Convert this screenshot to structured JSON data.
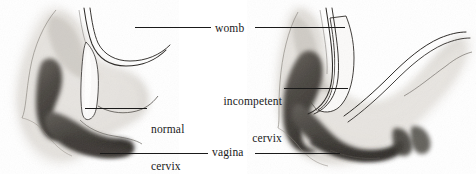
{
  "figure": {
    "medium": "grayscale pencil and wash medical illustration",
    "panel_count": 2,
    "background_color": "#ffffff",
    "ink_color": "#1a1a1a"
  },
  "labels": {
    "womb": "womb",
    "vagina": "vagina",
    "normal_cervix_line1": "normal",
    "normal_cervix_line2": "cervix",
    "incompetent_cervix_line1": "incompetent",
    "incompetent_cervix_line2": "cervix"
  },
  "panels": [
    {
      "id": "left-panel",
      "name": "normal-cervix-illustration",
      "description": "Sagittal section of uterus with a long closed normal cervix",
      "labels_applied": [
        "womb",
        "normal cervix",
        "vagina"
      ]
    },
    {
      "id": "right-panel",
      "name": "incompetent-cervix-illustration",
      "description": "Sagittal section of uterus with a short dilated incompetent cervix",
      "labels_applied": [
        "womb",
        "incompetent cervix",
        "vagina"
      ]
    }
  ],
  "leader_lines": [
    {
      "name": "womb-left",
      "x1": 135,
      "y1": 27,
      "x2": 211,
      "y2": 27
    },
    {
      "name": "womb-right",
      "x1": 255,
      "y1": 27,
      "x2": 345,
      "y2": 27
    },
    {
      "name": "normal-cervix",
      "x1": 85,
      "y1": 108,
      "x2": 147,
      "y2": 108
    },
    {
      "name": "incompetent-cervix",
      "x1": 284,
      "y1": 88,
      "x2": 348,
      "y2": 88
    },
    {
      "name": "vagina-left",
      "x1": 100,
      "y1": 153,
      "x2": 208,
      "y2": 153
    },
    {
      "name": "vagina-right",
      "x1": 255,
      "y1": 153,
      "x2": 340,
      "y2": 153
    }
  ],
  "tones": {
    "paper": "#ffffff",
    "tissue_light": "#dedbd6",
    "tissue_mid": "#b9b5ae",
    "tissue_shadow": "#8d8881",
    "cavity_dark": "#55514c",
    "cavity_darkest": "#3a3733",
    "outline": "#2a2724"
  }
}
